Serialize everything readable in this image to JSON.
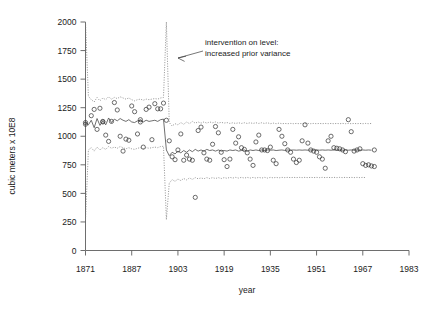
{
  "chart_data": {
    "type": "line",
    "title": "",
    "xlabel": "year",
    "ylabel": "cubic meters x 10E8",
    "xlim": [
      1871,
      1983
    ],
    "ylim": [
      0,
      2000
    ],
    "grid": false,
    "legend": "none",
    "xticks": [
      1871,
      1887,
      1903,
      1919,
      1935,
      1951,
      1967,
      1983
    ],
    "yticks": [
      0,
      250,
      500,
      750,
      1000,
      1250,
      1500,
      1750,
      2000
    ],
    "annotations": [
      {
        "name": "intervention-annotation",
        "line1": "intervention on level:",
        "line2": "increased prior variance",
        "points_to_year": 1899,
        "arrow": "left"
      }
    ],
    "series": [
      {
        "name": "filtered level (mean)",
        "style": "solid",
        "x": [
          1871,
          1872,
          1873,
          1874,
          1875,
          1876,
          1877,
          1878,
          1879,
          1880,
          1881,
          1882,
          1883,
          1884,
          1885,
          1886,
          1887,
          1888,
          1889,
          1890,
          1891,
          1892,
          1893,
          1894,
          1895,
          1896,
          1897,
          1898,
          1899,
          1900,
          1901,
          1902,
          1903,
          1904,
          1905,
          1906,
          1907,
          1908,
          1909,
          1910,
          1911,
          1912,
          1913,
          1914,
          1915,
          1916,
          1917,
          1918,
          1919,
          1920,
          1921,
          1922,
          1923,
          1924,
          1925,
          1926,
          1927,
          1928,
          1929,
          1930,
          1931,
          1932,
          1933,
          1934,
          1935,
          1936,
          1937,
          1938,
          1939,
          1940,
          1941,
          1942,
          1943,
          1944,
          1945,
          1946,
          1947,
          1948,
          1949,
          1950,
          1951,
          1952,
          1953,
          1954,
          1955,
          1956,
          1957,
          1958,
          1959,
          1960,
          1961,
          1962,
          1963,
          1964,
          1965,
          1966,
          1967,
          1968,
          1969,
          1970
        ],
        "values": [
          1120,
          1100,
          1140,
          1075,
          1155,
          1095,
          1135,
          1100,
          1160,
          1120,
          1150,
          1135,
          1155,
          1140,
          1130,
          1145,
          1125,
          1120,
          1135,
          1140,
          1125,
          1140,
          1130,
          1135,
          1140,
          1130,
          1145,
          1150,
          880,
          830,
          860,
          845,
          870,
          855,
          875,
          860,
          880,
          865,
          885,
          870,
          880,
          870,
          885,
          875,
          880,
          870,
          880,
          870,
          875,
          870,
          880,
          875,
          880,
          870,
          875,
          880,
          870,
          880,
          875,
          880,
          875,
          880,
          875,
          880,
          878,
          880,
          875,
          878,
          880,
          876,
          880,
          878,
          880,
          878,
          880,
          878,
          880,
          878,
          880,
          878,
          880,
          878,
          880,
          878,
          880,
          878,
          880,
          878,
          880,
          878,
          880,
          878,
          880,
          878,
          880,
          878,
          880,
          878,
          880,
          878
        ]
      },
      {
        "name": "upper prior band",
        "style": "dotted",
        "values": [
          2000,
          1350,
          1320,
          1300,
          1340,
          1310,
          1335,
          1320,
          1345,
          1325,
          1340,
          1330,
          1345,
          1335,
          1325,
          1335,
          1320,
          1310,
          1320,
          1325,
          1315,
          1325,
          1320,
          1325,
          1330,
          1325,
          1335,
          1340,
          2000,
          1120,
          1090,
          1110,
          1100,
          1120,
          1105,
          1125,
          1110,
          1130,
          1115,
          1125,
          1115,
          1125,
          1115,
          1125,
          1118,
          1125,
          1115,
          1122,
          1115,
          1120,
          1112,
          1118,
          1112,
          1118,
          1112,
          1118,
          1112,
          1118,
          1112,
          1118,
          1112,
          1118,
          1112,
          1118,
          1110,
          1115,
          1110,
          1115,
          1110,
          1112,
          1110,
          1112,
          1110,
          1112,
          1110,
          1112,
          1110,
          1112,
          1110,
          1112,
          1110,
          1112,
          1110,
          1112,
          1110,
          1112,
          1110,
          1112,
          1110,
          1112,
          1110,
          1112,
          1110,
          1112,
          1110,
          1112,
          1110,
          1112,
          1110,
          1112
        ]
      },
      {
        "name": "lower prior band",
        "style": "dotted",
        "values": [
          270,
          880,
          900,
          870,
          905,
          880,
          900,
          885,
          910,
          895,
          905,
          895,
          910,
          900,
          890,
          900,
          890,
          885,
          895,
          900,
          890,
          900,
          895,
          900,
          905,
          900,
          910,
          912,
          270,
          590,
          620,
          605,
          625,
          612,
          630,
          618,
          635,
          622,
          638,
          628,
          635,
          628,
          638,
          630,
          638,
          630,
          638,
          630,
          638,
          632,
          640,
          634,
          640,
          634,
          640,
          634,
          640,
          634,
          640,
          634,
          640,
          634,
          640,
          634,
          640,
          636,
          640,
          636,
          640,
          638,
          640,
          638,
          640,
          638,
          640,
          638,
          640,
          638,
          640,
          638,
          640,
          638,
          640,
          638,
          640,
          638,
          640,
          638,
          640,
          638,
          640,
          638,
          640,
          638,
          640,
          638,
          640,
          638
        ]
      }
    ],
    "observations": [
      {
        "x": 1871,
        "y": 1120
      },
      {
        "x": 1871,
        "y": 1105
      },
      {
        "x": 1873,
        "y": 1180
      },
      {
        "x": 1874,
        "y": 1235
      },
      {
        "x": 1875,
        "y": 1060
      },
      {
        "x": 1876,
        "y": 1245
      },
      {
        "x": 1877,
        "y": 1130
      },
      {
        "x": 1877,
        "y": 1125
      },
      {
        "x": 1878,
        "y": 1010
      },
      {
        "x": 1879,
        "y": 955
      },
      {
        "x": 1880,
        "y": 1130
      },
      {
        "x": 1881,
        "y": 1295
      },
      {
        "x": 1882,
        "y": 1230
      },
      {
        "x": 1883,
        "y": 1000
      },
      {
        "x": 1884,
        "y": 870
      },
      {
        "x": 1885,
        "y": 975
      },
      {
        "x": 1886,
        "y": 965
      },
      {
        "x": 1887,
        "y": 1265
      },
      {
        "x": 1888,
        "y": 1215
      },
      {
        "x": 1889,
        "y": 1020
      },
      {
        "x": 1890,
        "y": 1145
      },
      {
        "x": 1890,
        "y": 1125
      },
      {
        "x": 1891,
        "y": 905
      },
      {
        "x": 1892,
        "y": 1235
      },
      {
        "x": 1893,
        "y": 1255
      },
      {
        "x": 1894,
        "y": 970
      },
      {
        "x": 1895,
        "y": 1285
      },
      {
        "x": 1896,
        "y": 1240
      },
      {
        "x": 1897,
        "y": 1240
      },
      {
        "x": 1898,
        "y": 1290
      },
      {
        "x": 1899,
        "y": 1140
      },
      {
        "x": 1900,
        "y": 960
      },
      {
        "x": 1901,
        "y": 820
      },
      {
        "x": 1902,
        "y": 795
      },
      {
        "x": 1903,
        "y": 880
      },
      {
        "x": 1904,
        "y": 1020
      },
      {
        "x": 1905,
        "y": 790
      },
      {
        "x": 1906,
        "y": 835
      },
      {
        "x": 1907,
        "y": 800
      },
      {
        "x": 1908,
        "y": 790
      },
      {
        "x": 1909,
        "y": 465
      },
      {
        "x": 1910,
        "y": 1050
      },
      {
        "x": 1911,
        "y": 1080
      },
      {
        "x": 1912,
        "y": 855
      },
      {
        "x": 1913,
        "y": 800
      },
      {
        "x": 1914,
        "y": 790
      },
      {
        "x": 1915,
        "y": 930
      },
      {
        "x": 1916,
        "y": 1085
      },
      {
        "x": 1917,
        "y": 1030
      },
      {
        "x": 1918,
        "y": 860
      },
      {
        "x": 1919,
        "y": 795
      },
      {
        "x": 1920,
        "y": 735
      },
      {
        "x": 1921,
        "y": 800
      },
      {
        "x": 1922,
        "y": 1060
      },
      {
        "x": 1923,
        "y": 940
      },
      {
        "x": 1924,
        "y": 995
      },
      {
        "x": 1925,
        "y": 900
      },
      {
        "x": 1926,
        "y": 885
      },
      {
        "x": 1927,
        "y": 855
      },
      {
        "x": 1928,
        "y": 800
      },
      {
        "x": 1929,
        "y": 745
      },
      {
        "x": 1930,
        "y": 950
      },
      {
        "x": 1931,
        "y": 1010
      },
      {
        "x": 1932,
        "y": 880
      },
      {
        "x": 1933,
        "y": 880
      },
      {
        "x": 1934,
        "y": 875
      },
      {
        "x": 1935,
        "y": 905
      },
      {
        "x": 1936,
        "y": 790
      },
      {
        "x": 1937,
        "y": 760
      },
      {
        "x": 1938,
        "y": 1060
      },
      {
        "x": 1939,
        "y": 1000
      },
      {
        "x": 1940,
        "y": 935
      },
      {
        "x": 1941,
        "y": 880
      },
      {
        "x": 1942,
        "y": 860
      },
      {
        "x": 1943,
        "y": 800
      },
      {
        "x": 1944,
        "y": 770
      },
      {
        "x": 1945,
        "y": 790
      },
      {
        "x": 1946,
        "y": 960
      },
      {
        "x": 1947,
        "y": 1100
      },
      {
        "x": 1948,
        "y": 940
      },
      {
        "x": 1949,
        "y": 880
      },
      {
        "x": 1950,
        "y": 870
      },
      {
        "x": 1951,
        "y": 860
      },
      {
        "x": 1952,
        "y": 820
      },
      {
        "x": 1953,
        "y": 800
      },
      {
        "x": 1954,
        "y": 720
      },
      {
        "x": 1955,
        "y": 960
      },
      {
        "x": 1956,
        "y": 1000
      },
      {
        "x": 1957,
        "y": 900
      },
      {
        "x": 1958,
        "y": 895
      },
      {
        "x": 1959,
        "y": 890
      },
      {
        "x": 1960,
        "y": 880
      },
      {
        "x": 1961,
        "y": 865
      },
      {
        "x": 1962,
        "y": 1145
      },
      {
        "x": 1963,
        "y": 1040
      },
      {
        "x": 1964,
        "y": 870
      },
      {
        "x": 1965,
        "y": 880
      },
      {
        "x": 1966,
        "y": 890
      },
      {
        "x": 1967,
        "y": 760
      },
      {
        "x": 1968,
        "y": 745
      },
      {
        "x": 1969,
        "y": 750
      },
      {
        "x": 1970,
        "y": 740
      },
      {
        "x": 1971,
        "y": 880
      },
      {
        "x": 1971,
        "y": 735
      }
    ]
  }
}
